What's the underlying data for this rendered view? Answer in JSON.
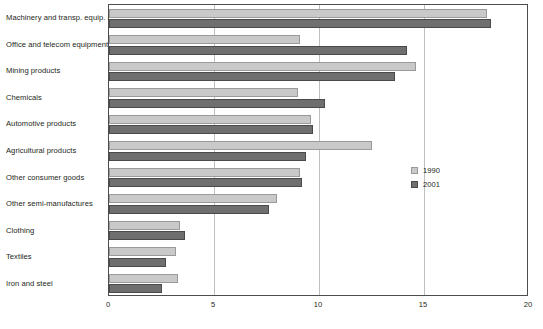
{
  "chart_data": {
    "type": "bar",
    "orientation": "horizontal",
    "title": "",
    "subtitle": "",
    "xlabel": "",
    "ylabel": "",
    "xlim": [
      0,
      20
    ],
    "xticks": [
      0,
      5,
      10,
      15,
      20
    ],
    "xtick_labels": [
      "0",
      "5",
      "10",
      "15",
      "20"
    ],
    "grid": true,
    "grid_axis": "x",
    "legend_position": "center-right",
    "categories": [
      "Machinery and transp. equip. a",
      "Office and telecom equipment",
      "Mining products",
      "Chemicals",
      "Automotive products",
      "Agricultural products",
      "Other consumer goods",
      "Other semi-manufactures",
      "Clothing",
      "Textiles",
      "Iron and steel"
    ],
    "series": [
      {
        "name": "1990",
        "color": "#c9c9c9",
        "values": [
          18.0,
          9.1,
          14.6,
          9.0,
          9.6,
          12.5,
          9.1,
          8.0,
          3.4,
          3.2,
          3.3
        ]
      },
      {
        "name": "2001",
        "color": "#6f6f6f",
        "values": [
          18.2,
          14.2,
          13.6,
          10.3,
          9.7,
          9.4,
          9.2,
          7.6,
          3.6,
          2.7,
          2.5
        ]
      }
    ]
  },
  "legend": {
    "entries": [
      {
        "label": "1990",
        "swatch_class": "y1990"
      },
      {
        "label": "2001",
        "swatch_class": "y2001"
      }
    ]
  }
}
